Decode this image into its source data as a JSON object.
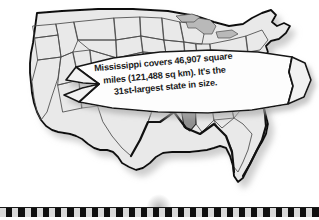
{
  "figure": {
    "kind": "us-state-map-with-fact-banner",
    "alt_title": "Map of the contiguous United States with Mississippi highlighted",
    "background_color": "#ffffff"
  },
  "map": {
    "name": "united-states-map",
    "region_label": "Contiguous United States",
    "state_fill_color": "#e9e9e9",
    "state_border_color": "#4a4a4a",
    "outline_color": "#111111",
    "shadow_color": "#9a9a9a",
    "highlight": {
      "state_name": "Mississippi",
      "fill_color": "#8f8f8f",
      "border_color": "#1a1a1a"
    },
    "secondary_shades": [
      {
        "region": "great-lakes-water",
        "fill_color": "#b9b9b9"
      }
    ]
  },
  "banner": {
    "name": "fact-ribbon",
    "fill_color": "#fdfdfd",
    "border_color": "#151515",
    "shadow_color": "#8c8c8c",
    "text_color": "#1b1b1b",
    "rotation_degrees": -5.2,
    "lines": [
      "Mississippi covers 46,907 square",
      "miles (121,488 sq km). It's the",
      "31st-largest state in size."
    ],
    "full_text": "Mississippi covers 46,907 square miles (121,488 sq km). It's the 31st-largest state in size.",
    "facts": {
      "state": "Mississippi",
      "area_square_miles": "46,907",
      "area_square_kilometers": "121,488",
      "size_rank": "31st-largest"
    }
  },
  "footer_strip": {
    "name": "checkered-filmstrip",
    "dark_color": "#101010",
    "light_color": "#d9d9d9",
    "cell_count": 26,
    "rule_color": "#1a1a1a"
  }
}
